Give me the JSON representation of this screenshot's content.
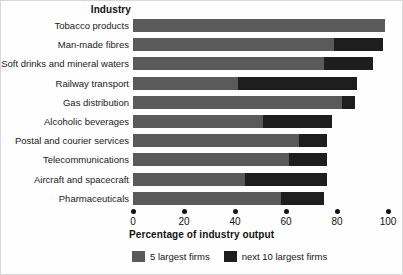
{
  "heading": "Industry",
  "axis_title": "Percentage of industry output",
  "legend": [
    {
      "label": "5 largest firms",
      "color": "#5a5a5a",
      "key": "five_largest"
    },
    {
      "label": "next 10 largest firms",
      "color": "#1e1e1e",
      "key": "next_ten_largest"
    }
  ],
  "chart_data": {
    "type": "bar",
    "orientation": "horizontal",
    "stacked": true,
    "title": "Industry",
    "xlabel": "Percentage of industry output",
    "ylabel": "Industry",
    "xlim": [
      0,
      100
    ],
    "xticks": [
      0,
      20,
      40,
      60,
      80,
      100
    ],
    "xtick_labels": [
      "0",
      "20",
      "40",
      "60",
      "80",
      "100"
    ],
    "grid": false,
    "legend_position": "bottom",
    "categories": [
      "Tobacco products",
      "Man-made fibres",
      "Soft drinks and mineral waters",
      "Railway transport",
      "Gas distribution",
      "Alcoholic beverages",
      "Postal and courier services",
      "Telecommunications",
      "Aircraft and spacecraft",
      "Pharmaceuticals"
    ],
    "series": [
      {
        "name": "5 largest firms",
        "color": "#5a5a5a",
        "values": [
          99,
          79,
          75,
          41,
          82,
          51,
          65,
          61,
          44,
          58
        ]
      },
      {
        "name": "next 10 largest firms",
        "color": "#1e1e1e",
        "values": [
          0,
          19,
          19,
          47,
          5,
          27,
          11,
          15,
          32,
          17
        ]
      }
    ],
    "totals": [
      99,
      98,
      94,
      88,
      87,
      78,
      76,
      76,
      76,
      75
    ]
  }
}
